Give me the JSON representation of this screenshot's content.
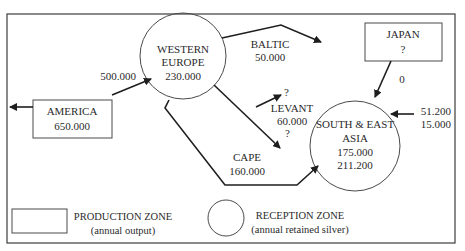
{
  "diagram": {
    "nodes": {
      "america": {
        "type": "production",
        "name": "AMERICA",
        "value": "650.000"
      },
      "western_europe": {
        "type": "reception",
        "name_line1": "WESTERN",
        "name_line2": "EUROPE",
        "value": "230.000"
      },
      "japan": {
        "type": "production",
        "name": "JAPAN",
        "value": "?"
      },
      "south_east_asia": {
        "type": "reception",
        "name_line1": "SOUTH & EAST",
        "name_line2": "ASIA",
        "value1": "175.000",
        "value2": "211.200"
      }
    },
    "flows": {
      "america_to_europe": {
        "label": "500.000"
      },
      "baltic": {
        "name": "BALTIC",
        "value": "50.000"
      },
      "levant": {
        "name": "LEVANT",
        "value": "60.000",
        "top_unknown": "?",
        "bottom_unknown": "?"
      },
      "cape": {
        "name": "CAPE",
        "value": "160.000"
      },
      "japan_to_asia": {
        "label": "0"
      },
      "external_to_asia": {
        "value1": "51.200",
        "value2": "15.000"
      }
    },
    "legend": {
      "production": {
        "title": "PRODUCTION ZONE",
        "subtitle": "(annual output)"
      },
      "reception": {
        "title": "RECEPTION ZONE",
        "subtitle": "(annual retained silver)"
      }
    }
  }
}
